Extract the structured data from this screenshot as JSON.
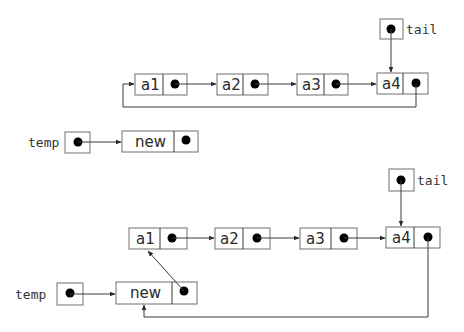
{
  "diagram": {
    "colors": {
      "border": "#6f6f6f",
      "line": "#3a3a3a",
      "dot": "#000000",
      "text": "#2a2a2a"
    },
    "before": {
      "nodes": [
        {
          "label": "a1"
        },
        {
          "label": "a2"
        },
        {
          "label": "a3"
        },
        {
          "label": "a4"
        }
      ],
      "tail_pointer_label": "tail",
      "temp_pointer_label": "temp",
      "new_node_label": "new"
    },
    "after": {
      "nodes": [
        {
          "label": "a1"
        },
        {
          "label": "a2"
        },
        {
          "label": "a3"
        },
        {
          "label": "a4"
        }
      ],
      "tail_pointer_label": "tail",
      "temp_pointer_label": "temp",
      "new_node_label": "new"
    }
  }
}
